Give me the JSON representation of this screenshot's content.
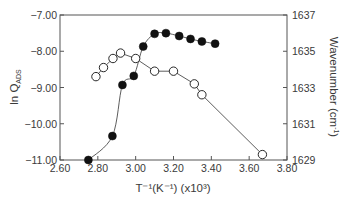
{
  "chart_data": {
    "type": "scatter",
    "title": "",
    "xlabel": "T⁻¹(K⁻¹) (x10³)",
    "ylabel": "ln Q_ADS",
    "ylabel_main": "ln Q",
    "ylabel_sub": "ADS",
    "y2label": "Wavenumber (cm⁻¹)",
    "y2label_main": "Wavenumber (cm",
    "y2label_sup": "-1",
    "y2label_end": ")",
    "xlim": [
      2.6,
      3.8
    ],
    "ylim": [
      -11.0,
      -7.0
    ],
    "y2lim": [
      1629,
      1637
    ],
    "x_ticks": [
      "2.60",
      "2.80",
      "3.00",
      "3.20",
      "3.40",
      "3.60",
      "3.80"
    ],
    "y_ticks": [
      "-7.00",
      "-8.00",
      "-9.00",
      "-10.00",
      "-11.00"
    ],
    "y2_ticks": [
      "1637",
      "1635",
      "1633",
      "1631",
      "1629"
    ],
    "grid": false,
    "legend": null,
    "series": [
      {
        "name": "ln Q_ADS",
        "axis": "left",
        "marker": "filled-circle",
        "line": "smooth",
        "x": [
          2.75,
          2.877,
          2.93,
          2.99,
          3.04,
          3.1,
          3.16,
          3.23,
          3.29,
          3.35,
          3.42
        ],
        "y": [
          -11.0,
          -10.34,
          -8.93,
          -8.68,
          -7.87,
          -7.52,
          -7.5,
          -7.58,
          -7.66,
          -7.73,
          -7.79
        ]
      },
      {
        "name": "Wavenumber",
        "axis": "right",
        "marker": "open-circle",
        "line": "straight",
        "x": [
          2.79,
          2.83,
          2.88,
          2.92,
          3.0,
          3.1,
          3.2,
          3.31,
          3.35,
          3.67
        ],
        "y": [
          1633.6,
          1634.1,
          1634.6,
          1634.9,
          1634.6,
          1633.9,
          1633.9,
          1633.2,
          1632.6,
          1629.3
        ]
      }
    ]
  },
  "colors": {
    "axis": "#555555",
    "text": "#3a3a3a",
    "marker": "#111111",
    "line": "#333333",
    "background": "#ffffff"
  }
}
